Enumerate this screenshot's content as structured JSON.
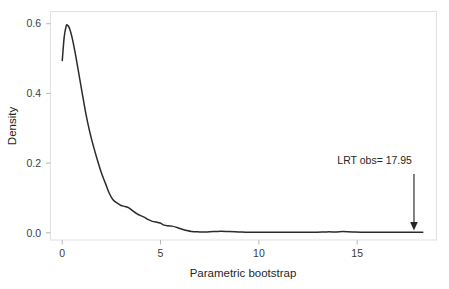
{
  "chart_data": {
    "type": "line",
    "title": "",
    "subtitle": "",
    "xlabel": "Parametric bootstrap",
    "ylabel": "Density",
    "xlim": [
      -0.6,
      19.1
    ],
    "ylim": [
      -0.02,
      0.655
    ],
    "grid": false,
    "legend": null,
    "x_ticks": [
      0,
      5,
      10,
      15
    ],
    "x_tick_labels": [
      "0",
      "5",
      "10",
      "15"
    ],
    "y_ticks": [
      0.0,
      0.2,
      0.4,
      0.6
    ],
    "y_tick_labels": [
      "0.0",
      "0.2",
      "0.4",
      "0.6"
    ],
    "series": [
      {
        "name": "Parametric bootstrap density",
        "color": "#2b2b2b",
        "x": [
          0.0,
          0.1,
          0.2,
          0.25,
          0.35,
          0.45,
          0.55,
          0.7,
          0.85,
          1.0,
          1.2,
          1.4,
          1.6,
          1.8,
          2.0,
          2.2,
          2.4,
          2.6,
          2.8,
          3.0,
          3.2,
          3.4,
          3.6,
          3.8,
          4.0,
          4.2,
          4.4,
          4.6,
          4.8,
          5.0,
          5.2,
          5.4,
          5.6,
          5.8,
          6.0,
          6.3,
          6.6,
          7.0,
          7.4,
          7.8,
          8.1,
          8.5,
          9.0,
          9.5,
          10.0,
          10.5,
          11.0,
          11.5,
          12.0,
          12.5,
          13.0,
          13.5,
          14.0,
          14.3,
          14.8,
          15.5,
          16.2,
          17.0,
          17.6,
          18.1,
          18.4
        ],
        "y": [
          0.51,
          0.58,
          0.612,
          0.615,
          0.608,
          0.59,
          0.565,
          0.52,
          0.47,
          0.42,
          0.355,
          0.3,
          0.255,
          0.215,
          0.178,
          0.148,
          0.118,
          0.098,
          0.089,
          0.082,
          0.079,
          0.075,
          0.066,
          0.058,
          0.052,
          0.047,
          0.04,
          0.035,
          0.033,
          0.03,
          0.024,
          0.022,
          0.021,
          0.018,
          0.014,
          0.009,
          0.005,
          0.004,
          0.004,
          0.005,
          0.006,
          0.005,
          0.004,
          0.003,
          0.003,
          0.003,
          0.003,
          0.003,
          0.003,
          0.003,
          0.003,
          0.004,
          0.004,
          0.005,
          0.004,
          0.003,
          0.003,
          0.003,
          0.003,
          0.003,
          0.003
        ],
        "peak_x": 0.25,
        "peak_y": 0.615,
        "start_y": 0.51
      }
    ],
    "annotations": [
      {
        "name": "lrt-observed",
        "label": "LRT obs= 17.95",
        "x": 17.95,
        "y_text": 0.205,
        "arrow_from_y": 0.175,
        "arrow_to_y": 0.008,
        "arrow": "down"
      }
    ]
  },
  "axes": {
    "x_title": "Parametric bootstrap",
    "y_title": "Density",
    "x_tick_labels": [
      "0",
      "5",
      "10",
      "15"
    ],
    "y_tick_labels": [
      "0.0",
      "0.2",
      "0.4",
      "0.6"
    ]
  },
  "annotation": {
    "lrt_label": "LRT obs= 17.95"
  },
  "colors": {
    "curve": "#2b2b2b",
    "frame": "#e2e2e2",
    "tick": "#b8b8b8",
    "tick_text": "#3b3b3b",
    "title_text": "#262626",
    "background": "#ffffff"
  }
}
